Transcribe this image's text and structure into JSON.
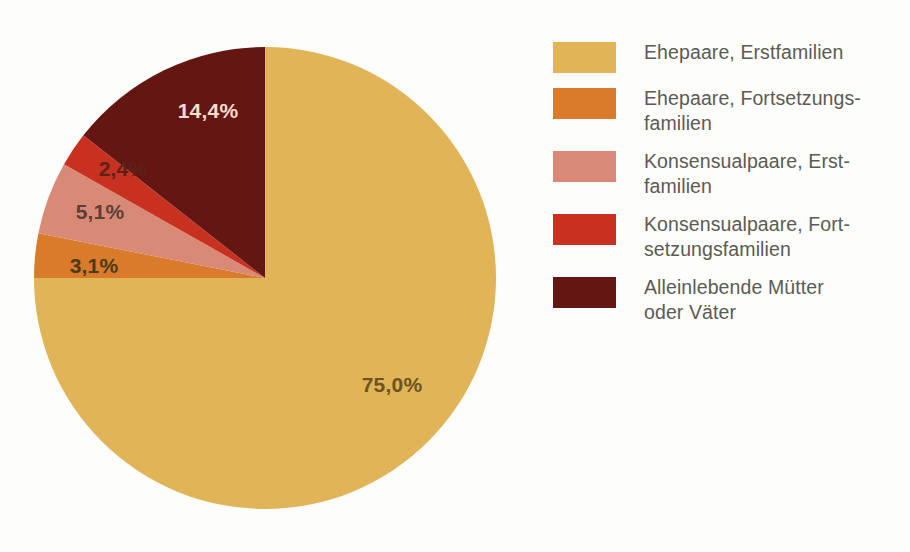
{
  "background_color": "#fdfdfc",
  "chart_data": {
    "type": "pie",
    "title": "",
    "subtitle": "",
    "xlabel": "",
    "ylabel": "",
    "legend_position": "right",
    "grid": false,
    "value_suffix": "%",
    "decimal_separator": ",",
    "start_angle_deg": 0,
    "direction": "clockwise",
    "categories": [
      "Ehepaare, Erstfamilien",
      "Ehepaare, Fortsetzungsfamilien",
      "Konsensualpaare, Erstfamilien",
      "Konsensualpaare, Fortsetzungsfamilien",
      "Alleinlebende Mütter oder Väter"
    ],
    "values": [
      75.0,
      3.1,
      5.1,
      2.4,
      14.4
    ],
    "labels": [
      "75,0%",
      "3,1%",
      "5,1%",
      "2,4%",
      "14,4%"
    ],
    "colors": [
      "#e0b457",
      "#d97b2b",
      "#d98a76",
      "#c8311f",
      "#641612"
    ],
    "label_colors": [
      "#6b5420",
      "#4a3a18",
      "#5a4038",
      "#5e2018",
      "#f2ded0"
    ]
  },
  "pie": {
    "center_x": 265,
    "center_y": 278,
    "radius": 231,
    "slices": [
      {
        "name": "ehepaare-erstfamilien",
        "value": 75.0,
        "label": "75,0%",
        "color": "#e0b457",
        "label_color": "#6b5420",
        "label_x": 392,
        "label_y": 392,
        "label_anchor": "middle"
      },
      {
        "name": "ehepaare-fortsetzungsfamilien",
        "value": 3.1,
        "label": "3,1%",
        "color": "#d97b2b",
        "label_color": "#4a3a18",
        "label_x": 94,
        "label_y": 273,
        "label_anchor": "middle"
      },
      {
        "name": "konsensualpaare-erstfamilien",
        "value": 5.1,
        "label": "5,1%",
        "color": "#d98a76",
        "label_color": "#5a4038",
        "label_x": 100,
        "label_y": 219,
        "label_anchor": "middle"
      },
      {
        "name": "konsensualpaare-fortsetzungsfamilien",
        "value": 2.4,
        "label": "2,4%",
        "color": "#c8311f",
        "label_color": "#5e2018",
        "label_x": 123,
        "label_y": 176,
        "label_anchor": "middle"
      },
      {
        "name": "alleinlebende-muetter-oder-vaeter",
        "value": 14.4,
        "label": "14,4%",
        "color": "#641612",
        "label_color": "#f2ded0",
        "label_x": 208,
        "label_y": 118,
        "label_anchor": "middle"
      }
    ]
  },
  "legend": {
    "text_color": "#5b5b53",
    "items": [
      {
        "name": "ehepaare-erstfamilien",
        "label": "Ehepaare, Erstfamilien",
        "color": "#e0b457"
      },
      {
        "name": "ehepaare-fortsetzungsfamilien",
        "label": "Ehepaare, Fortsetzungs-\nfamilien",
        "color": "#d97b2b"
      },
      {
        "name": "konsensualpaare-erstfamilien",
        "label": "Konsensualpaare, Erst-\nfamilien",
        "color": "#d98a76"
      },
      {
        "name": "konsensualpaare-fortsetzungsfamilien",
        "label": "Konsensualpaare, Fort-\nsetzungsfamilien",
        "color": "#c8311f"
      },
      {
        "name": "alleinlebende-muetter-oder-vaeter",
        "label": "Alleinlebende Mütter\noder Väter",
        "color": "#641612"
      }
    ]
  }
}
